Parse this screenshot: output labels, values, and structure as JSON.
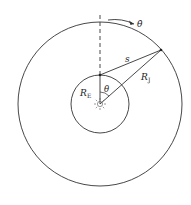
{
  "diagram": {
    "labels": {
      "theta_dot": "θ̇",
      "s": "s",
      "r_j": "R",
      "r_j_sub": "J",
      "r_e": "R",
      "r_e_sub": "E",
      "theta": "θ"
    },
    "colors": {
      "stroke": "#333333",
      "background": "#ffffff"
    }
  }
}
